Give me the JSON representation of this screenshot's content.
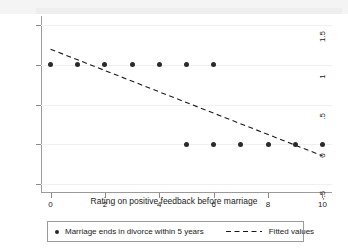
{
  "chart_data": {
    "type": "scatter",
    "title": "",
    "xlabel": "Rating on positive feedback before marriage",
    "ylabel": "",
    "xlim": [
      -0.35,
      10.35
    ],
    "ylim": [
      -0.62,
      1.62
    ],
    "xticks": [
      0,
      2,
      4,
      6,
      8,
      10
    ],
    "xtick_labels": [
      "0",
      "2",
      "4",
      "6",
      "8",
      "10"
    ],
    "yticks": [
      -0.5,
      0,
      0.5,
      1,
      1.5
    ],
    "ytick_labels": [
      "-.5",
      "0",
      ".5",
      "1",
      "1.5"
    ],
    "grid": "horizontal-faint",
    "legend_position": "bottom",
    "series": [
      {
        "name": "Marriage ends in divorce within 5 years",
        "type": "scatter",
        "marker": "filled-circle",
        "color": "#2a2a2a",
        "points": [
          {
            "x": 0,
            "y": 1
          },
          {
            "x": 1,
            "y": 1
          },
          {
            "x": 2,
            "y": 1
          },
          {
            "x": 3,
            "y": 1
          },
          {
            "x": 4,
            "y": 1
          },
          {
            "x": 5,
            "y": 1
          },
          {
            "x": 6,
            "y": 1
          },
          {
            "x": 5,
            "y": 0
          },
          {
            "x": 6,
            "y": 0
          },
          {
            "x": 7,
            "y": 0
          },
          {
            "x": 8,
            "y": 0
          },
          {
            "x": 9,
            "y": 0
          },
          {
            "x": 10,
            "y": 0
          }
        ]
      },
      {
        "name": "Fitted values",
        "type": "line",
        "style": "dashed",
        "color": "#1a1a1a",
        "endpoints": [
          {
            "x": 0,
            "y": 1.2
          },
          {
            "x": 10,
            "y": -0.15
          }
        ],
        "slope": -0.135,
        "intercept": 1.2
      }
    ]
  },
  "axis": {
    "x_title": "Rating on positive feedback before marriage",
    "x_tick_labels": [
      "0",
      "2",
      "4",
      "6",
      "8",
      "10"
    ],
    "y_tick_labels": [
      "1.5",
      "1",
      ".5",
      "0",
      "-.5"
    ]
  },
  "legend": {
    "entries": [
      {
        "label": "Marriage ends in divorce within 5 years",
        "marker": "dot"
      },
      {
        "label": "Fitted values",
        "marker": "dashed-line"
      }
    ]
  }
}
